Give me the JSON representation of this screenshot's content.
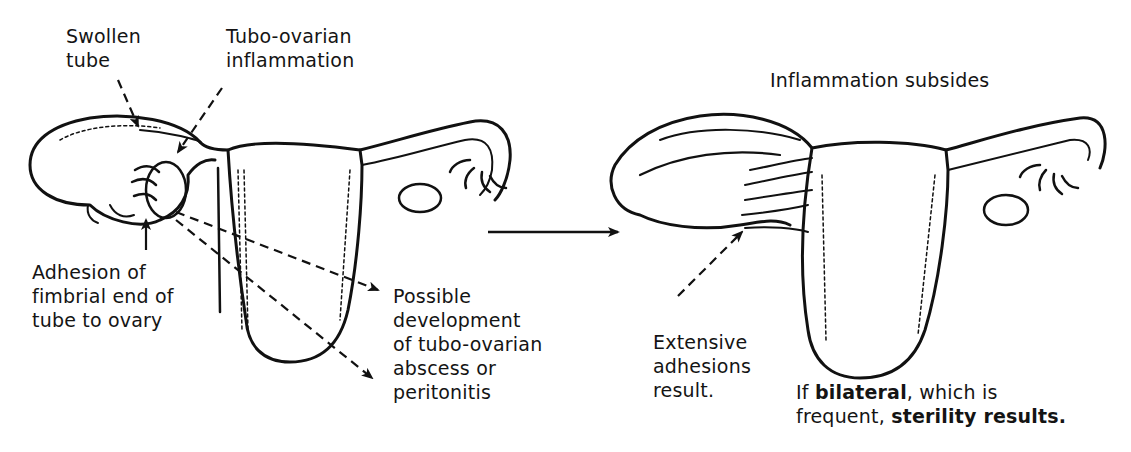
{
  "figure": {
    "type": "medical-illustration",
    "panels": [
      {
        "id": "before",
        "labels": {
          "swollen_tube": [
            "Swollen",
            "tube"
          ],
          "tubo_ovarian_inflammation": [
            "Tubo-ovarian",
            "inflammation"
          ],
          "adhesion": [
            "Adhesion of",
            "fimbrial end of",
            "tube to ovary"
          ],
          "possible_development": [
            "Possible",
            "development",
            "of tubo-ovarian",
            "abscess or",
            "peritonitis"
          ]
        }
      },
      {
        "id": "after",
        "labels": {
          "title": "Inflammation subsides",
          "extensive_adhesions": [
            "Extensive",
            "adhesions",
            "result."
          ],
          "bilateral_note": {
            "line1_prefix": "If ",
            "line1_bold": "bilateral",
            "line1_suffix": ", which is",
            "line2_prefix": "frequent, ",
            "line2_bold": "sterility results."
          }
        }
      }
    ],
    "transition_arrow": "arrow-right",
    "colors": {
      "ink": "#111111",
      "background": "#ffffff"
    }
  }
}
